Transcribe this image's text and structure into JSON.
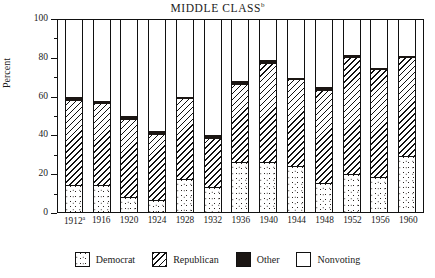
{
  "chart_data": {
    "type": "bar",
    "subtype": "stacked",
    "title": "MIDDLE CLASS",
    "title_superscript": "b",
    "xlabel": "",
    "ylabel": "Percent",
    "ylim": [
      0,
      100
    ],
    "ytick_labels": [
      "0",
      "20",
      "40",
      "60",
      "80",
      "100"
    ],
    "ytick_values": [
      0,
      20,
      40,
      60,
      80,
      100
    ],
    "yminor_ticks": [
      10,
      30,
      50,
      70,
      90
    ],
    "grid": false,
    "legend_position": "bottom",
    "categories": [
      "1912",
      "1916",
      "1920",
      "1924",
      "1928",
      "1932",
      "1936",
      "1940",
      "1944",
      "1948",
      "1952",
      "1956",
      "1960"
    ],
    "category_superscripts": [
      "a",
      "",
      "",
      "",
      "",
      "",
      "",
      "",
      "",
      "",
      "",
      "",
      ""
    ],
    "series": [
      {
        "name": "Democrat",
        "pattern": "stipple",
        "color": "#ffffff",
        "values": [
          14,
          14,
          8,
          6,
          17,
          13,
          26,
          26,
          24,
          15,
          20,
          18,
          29
        ]
      },
      {
        "name": "Republican",
        "pattern": "diagonal-hatch",
        "color": "#ffffff",
        "values": [
          44,
          42,
          40,
          34,
          42,
          25,
          40,
          51,
          45,
          48,
          60,
          56,
          51
        ]
      },
      {
        "name": "Other",
        "pattern": "solid",
        "color": "#1b1613",
        "values": [
          2,
          2,
          2,
          2,
          1,
          2,
          2,
          2,
          1,
          2,
          2,
          1,
          1
        ]
      },
      {
        "name": "Nonvoting",
        "pattern": "blank",
        "color": "#ffffff",
        "values": [
          40,
          42,
          50,
          58,
          40,
          60,
          32,
          21,
          30,
          35,
          18,
          25,
          19
        ]
      }
    ],
    "totals_voting": [
      60,
      58,
      50,
      42,
      60,
      40,
      68,
      79,
      70,
      65,
      82,
      75,
      81
    ]
  },
  "legend": {
    "items": [
      {
        "label": "Democrat",
        "swatch": "democrat-swatch"
      },
      {
        "label": "Republican",
        "swatch": "republican-swatch"
      },
      {
        "label": "Other",
        "swatch": "other-swatch"
      },
      {
        "label": "Nonvoting",
        "swatch": "nonvoting-swatch"
      }
    ]
  }
}
